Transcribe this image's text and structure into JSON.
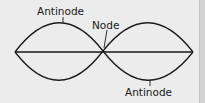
{
  "diagram": {
    "labels": {
      "antinode_top": "Antinode",
      "node": "Node",
      "antinode_bottom": "Antinode"
    },
    "colors": {
      "background": "#ececec",
      "line": "#1a1a1a",
      "right_bar": "#d2d2d2"
    }
  }
}
